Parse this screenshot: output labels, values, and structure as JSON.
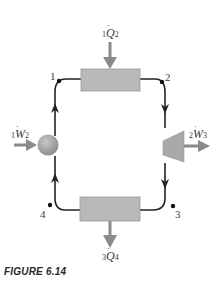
{
  "diagram": {
    "states": [
      {
        "id": "1",
        "label": "1"
      },
      {
        "id": "2",
        "label": "2"
      },
      {
        "id": "3",
        "label": "3"
      },
      {
        "id": "4",
        "label": "4"
      }
    ],
    "heat_in": {
      "pre": "1",
      "symbol": "Q",
      "dot": "·",
      "post": "2"
    },
    "heat_out": {
      "pre": "3",
      "symbol": "Q",
      "dot": "·",
      "post": "4"
    },
    "work_in": {
      "pre": "1",
      "symbol": "W",
      "dot": "·",
      "post": "2"
    },
    "work_out": {
      "pre": "2",
      "symbol": "W",
      "dot": "·",
      "post": "3"
    },
    "components": [
      "heater-box",
      "turbine",
      "cooler-box",
      "pump"
    ],
    "colors": {
      "line": "#222222",
      "box": "#b8b8b8",
      "arrow": "#8a8a8a",
      "pump": "#999999"
    }
  },
  "caption": "FIGURE 6.14"
}
